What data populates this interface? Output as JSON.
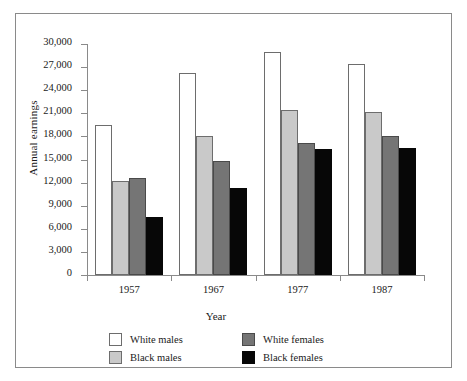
{
  "chart_data": {
    "type": "bar",
    "title": "",
    "xlabel": "Year",
    "ylabel": "Annual earnings",
    "categories": [
      "1957",
      "1967",
      "1977",
      "1987"
    ],
    "ylim": [
      0,
      30000
    ],
    "yticks": [
      0,
      3000,
      6000,
      9000,
      12000,
      15000,
      18000,
      21000,
      24000,
      27000,
      30000
    ],
    "ytick_labels": [
      "0",
      "3,000",
      "6,000",
      "9,000",
      "12,000",
      "15,000",
      "18,000",
      "21,000",
      "24,000",
      "27,000",
      "30,000"
    ],
    "grid": false,
    "legend_position": "bottom",
    "series": [
      {
        "name": "White males",
        "color": "#ffffff",
        "swatch_class": "s0",
        "values": [
          19500,
          26200,
          28900,
          27400
        ]
      },
      {
        "name": "Black males",
        "color": "#c9c9c9",
        "swatch_class": "s1",
        "values": [
          12200,
          18000,
          21400,
          21200
        ]
      },
      {
        "name": "White females",
        "color": "#757575",
        "swatch_class": "s2",
        "values": [
          12600,
          14800,
          17100,
          18000
        ]
      },
      {
        "name": "Black females",
        "color": "#070707",
        "swatch_class": "s3",
        "values": [
          7500,
          11300,
          16300,
          16500
        ]
      }
    ]
  }
}
